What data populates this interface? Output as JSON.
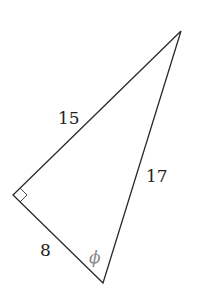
{
  "diagram": {
    "type": "right-triangle",
    "vertices": {
      "top": [
        181,
        31
      ],
      "right_angle": [
        13,
        195
      ],
      "bottom": [
        103,
        283
      ]
    },
    "sides": [
      {
        "id": "hyp_adj_top",
        "label": "15",
        "from": "right_angle",
        "to": "top"
      },
      {
        "id": "hypotenuse",
        "label": "17",
        "from": "top",
        "to": "bottom"
      },
      {
        "id": "short_leg",
        "label": "8",
        "from": "right_angle",
        "to": "bottom"
      }
    ],
    "angle": {
      "label": "ϕ",
      "at": "bottom",
      "color": "#8a8a8a"
    },
    "right_angle_marker": true,
    "stroke_color": "#2a2a2a",
    "text_color": "#222222"
  }
}
